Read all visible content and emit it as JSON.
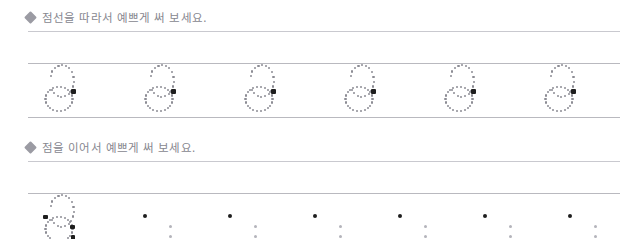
{
  "worksheet": {
    "language": "ko",
    "ink_colors": {
      "text": "#87878f",
      "bullet": "#9b9ba3",
      "rule": "#b9b9bf",
      "head_rule": "#c9c9cf",
      "trace_dot": "#8c8c94",
      "guide_dot": "#b4b4bb",
      "anchor_dot": "#1e1e1e"
    },
    "sections": [
      {
        "id": "trace-dotted-line",
        "bullet_icon": "diamond-bullet",
        "instruction": "점선을 따라서 예쁘게 써 보세요.",
        "row": {
          "mode": "full-dotted-outline",
          "closed_baseline": true,
          "glyph": "6",
          "glyph_count": 6,
          "anchor_marker": "square",
          "anchor_count_per_glyph": 1
        }
      },
      {
        "id": "connect-the-dots",
        "bullet_icon": "diamond-bullet",
        "instruction": "점을 이어서 예쁘게 써 보세요.",
        "row": {
          "mode": "exemplar-then-sparse-guides",
          "closed_baseline": false,
          "glyph": "6",
          "exemplar_count": 1,
          "guide_group_count": 6,
          "guide_group": {
            "anchor_dots": 1,
            "column_dots": 3
          }
        }
      }
    ]
  }
}
